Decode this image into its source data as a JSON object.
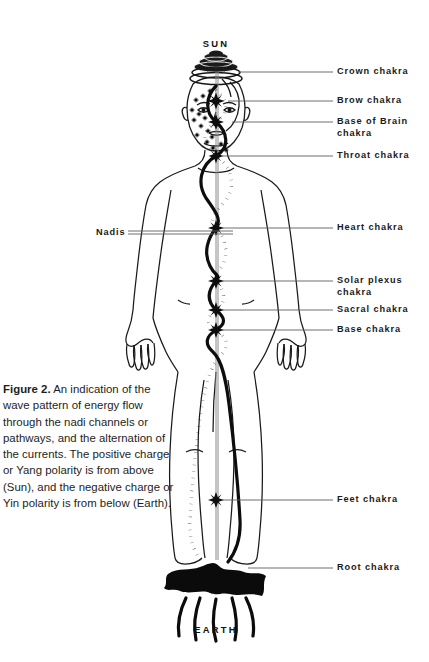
{
  "figure": {
    "top_pole": "SUN",
    "bottom_pole": "EARTH",
    "left_label": "Nadis",
    "caption_lead": "Figure 2.",
    "caption_body": " An indication of the wave pattern of energy flow through the nadi channels or pathways, and the alternation of the currents. The positive charge or Yang polarity is from above (Sun), and the negative charge or Yin polarity is from below (Earth)."
  },
  "labels": [
    {
      "text": "Crown chakra",
      "y": 72,
      "leader_from_x": 238,
      "leader_to_x": 333,
      "leader_y": 72
    },
    {
      "text": "Brow chakra",
      "y": 101,
      "leader_from_x": 228,
      "leader_to_x": 333,
      "leader_y": 101
    },
    {
      "text": "Base of Brain\nchakra",
      "y": 122,
      "leader_from_x": 232,
      "leader_to_x": 333,
      "leader_y": 122
    },
    {
      "text": "Throat chakra",
      "y": 156,
      "leader_from_x": 222,
      "leader_to_x": 333,
      "leader_y": 156
    },
    {
      "text": "Heart chakra",
      "y": 228,
      "leader_from_x": 218,
      "leader_to_x": 333,
      "leader_y": 228
    },
    {
      "text": "Solar plexus\nchakra",
      "y": 281,
      "leader_from_x": 218,
      "leader_to_x": 333,
      "leader_y": 281
    },
    {
      "text": "Sacral chakra",
      "y": 310,
      "leader_from_x": 218,
      "leader_to_x": 333,
      "leader_y": 310
    },
    {
      "text": "Base chakra",
      "y": 330,
      "leader_from_x": 218,
      "leader_to_x": 333,
      "leader_y": 330
    },
    {
      "text": "Feet chakra",
      "y": 500,
      "leader_from_x": 221,
      "leader_to_x": 333,
      "leader_y": 500
    },
    {
      "text": "Root chakra",
      "y": 568,
      "leader_from_x": 248,
      "leader_to_x": 333,
      "leader_y": 568
    }
  ],
  "chakras": [
    {
      "name": "brow",
      "cx": 216,
      "cy": 101,
      "r": 8.5
    },
    {
      "name": "base-of-brain",
      "cx": 216,
      "cy": 122,
      "r": 8.0
    },
    {
      "name": "throat",
      "cx": 216,
      "cy": 156,
      "r": 7.5
    },
    {
      "name": "heart",
      "cx": 216,
      "cy": 228,
      "r": 8.0
    },
    {
      "name": "solar-plexus",
      "cx": 216,
      "cy": 281,
      "r": 8.0
    },
    {
      "name": "sacral",
      "cx": 216,
      "cy": 310,
      "r": 8.0
    },
    {
      "name": "base",
      "cx": 216,
      "cy": 330,
      "r": 8.0
    },
    {
      "name": "feet",
      "cx": 216,
      "cy": 500,
      "r": 8.0
    }
  ],
  "colors": {
    "ink": "#111111",
    "leader_line": "#5a5a5a",
    "body_outline": "#1a1a1a",
    "text": "#1b1b1b",
    "background": "#ffffff"
  },
  "nadi_channels": {
    "solid_label": "ida-solid-channel",
    "dotted_label": "pingala-dotted-channel",
    "central_label": "sushumna-central-channel"
  }
}
